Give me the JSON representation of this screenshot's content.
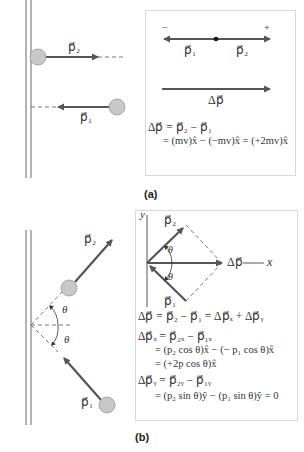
{
  "panel_a": {
    "label": "(a)",
    "scene": {
      "p2_label": "p⃗₂",
      "p1_label": "p⃗₁"
    },
    "box": {
      "minus_sign": "−",
      "plus_sign": "+",
      "p1_label": "p⃗₁",
      "p2_label": "p⃗₂",
      "dp_label": "Δp⃗",
      "eq_line1": "Δp⃗ = p⃗₂ − p⃗₁",
      "eq_line2": "= (mv)x̂ − (−mv)x̂ = (+2mv)x̂"
    }
  },
  "panel_b": {
    "label": "(b)",
    "scene": {
      "p2_label": "p⃗₂",
      "p1_label": "p⃗₁",
      "theta_upper": "θ",
      "theta_lower": "θ"
    },
    "box": {
      "y_axis": "y",
      "x_axis": "x",
      "p2_label": "p⃗₂",
      "p1_label": "p⃗₁",
      "theta_upper": "θ",
      "theta_lower": "θ",
      "dp_label": "Δp⃗",
      "eq1": "Δp⃗ = p⃗₂ − p⃗₁ = Δp⃗ₓ + Δp⃗ᵧ",
      "eq2": "Δp⃗ₓ = p⃗₂ₓ − p⃗₁ₓ",
      "eq3": "= (p₂ cos θ)x̂ − (− p₁ cos θ)x̂",
      "eq4": "= (+2p cos θ)x̂",
      "eq5": "Δp⃗ᵧ = p⃗₂ᵧ − p⃗₁ᵧ",
      "eq6": "= (p₂ sin θ)ŷ − (p₁ sin θ)ŷ = 0"
    }
  },
  "colors": {
    "arrow": "#555555",
    "ball": "#c8c8c8",
    "ball_stroke": "#999999",
    "wall": "#666666",
    "dashed": "#777777",
    "box_border": "#d8d8d8"
  }
}
